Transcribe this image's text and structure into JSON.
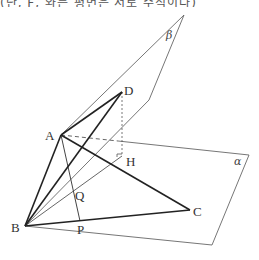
{
  "caption": "(단, F, 와는 평면은 서로 수직이다)",
  "diagram": {
    "planes": [
      {
        "name": "alpha",
        "label": "α",
        "vertices": [
          [
            118,
            141
          ],
          [
            249,
            155
          ],
          [
            212,
            245
          ],
          [
            25,
            226
          ]
        ]
      },
      {
        "name": "beta",
        "label": "β",
        "vertices": [
          [
            184,
            15
          ],
          [
            149,
            100
          ],
          [
            25,
            226
          ],
          [
            61,
            135
          ]
        ]
      }
    ],
    "points": {
      "A": {
        "label": "A",
        "x": 61,
        "y": 135
      },
      "B": {
        "label": "B",
        "x": 25,
        "y": 226
      },
      "C": {
        "label": "C",
        "x": 190,
        "y": 210
      },
      "D": {
        "label": "D",
        "x": 122,
        "y": 92
      },
      "H": {
        "label": "H",
        "x": 122,
        "y": 156
      },
      "P": {
        "label": "P",
        "x": 80,
        "y": 221
      },
      "Q": {
        "label": "Q",
        "x": 74,
        "y": 193
      }
    },
    "segments_bold": [
      "AB",
      "AD",
      "AC",
      "BD",
      "BC"
    ],
    "segments_thin": [
      "AP",
      "BH",
      "B-beta"
    ],
    "segments_dashed": [
      "DH",
      "A-alpha"
    ],
    "colors": {
      "line": "#333333",
      "plane": "#555555",
      "background": "#ffffff"
    }
  }
}
